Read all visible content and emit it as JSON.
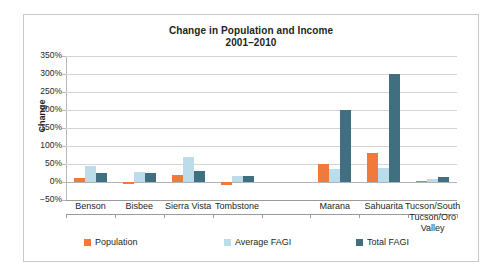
{
  "chart_data": {
    "type": "bar",
    "title": "Change in Population and Income",
    "subtitle": "2001–2010",
    "xlabel": "",
    "ylabel": "Change",
    "ylim": [
      -50,
      350
    ],
    "ytick_step": 50,
    "grid": true,
    "legend_position": "bottom",
    "ytick_labels": [
      "350%",
      "300%",
      "250%",
      "200%",
      "150%",
      "100%",
      "50%",
      "0%",
      "−50%"
    ],
    "categories": [
      "Benson",
      "Bisbee",
      "Sierra Vista",
      "Tombstone",
      "",
      "Marana",
      "Sahuarita",
      "Tucson/South Tucson/Oro Valley"
    ],
    "category_label_lines": [
      [
        "Benson"
      ],
      [
        "Bisbee"
      ],
      [
        "Sierra Vista"
      ],
      [
        "Tombstone"
      ],
      [
        ""
      ],
      [
        "Marana"
      ],
      [
        "Sahuarita"
      ],
      [
        "Tucson/South",
        "Tucson/Oro",
        "Valley"
      ]
    ],
    "series": [
      {
        "name": "Population",
        "color": "#f0793c",
        "values": [
          10,
          -5,
          20,
          -8,
          null,
          50,
          80,
          3
        ]
      },
      {
        "name": "Average FAGI",
        "color": "#bcdcea",
        "values": [
          45,
          28,
          70,
          18,
          null,
          35,
          40,
          8
        ]
      },
      {
        "name": "Total FAGI",
        "color": "#3f6f80",
        "values": [
          25,
          25,
          30,
          17,
          null,
          200,
          300,
          15
        ]
      }
    ]
  },
  "colors": {
    "population": "#f0793c",
    "average_fagi": "#bcdcea",
    "total_fagi": "#3f6f80",
    "frame_border": "#c9c9c9",
    "gridline": "#d4d4d4",
    "text": "#231f20"
  }
}
